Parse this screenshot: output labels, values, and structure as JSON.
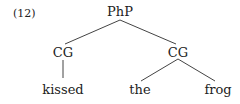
{
  "example_number": "(12)",
  "tree": {
    "root": "PhP",
    "left": {
      "label": "CG",
      "children": [
        "kissed"
      ]
    },
    "right": {
      "label": "CG",
      "children": [
        "the",
        "frog"
      ]
    }
  }
}
